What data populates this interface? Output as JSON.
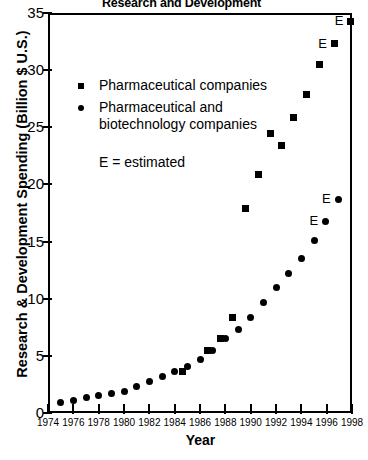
{
  "chart_data": {
    "type": "scatter",
    "title": "Research and Development",
    "xlabel": "Year",
    "ylabel": "Research & Development Spending (Billion $ U.S.)",
    "xlim": [
      1974,
      1998
    ],
    "ylim": [
      0,
      35
    ],
    "xticks": [
      1974,
      1976,
      1978,
      1980,
      1982,
      1984,
      1986,
      1988,
      1990,
      1992,
      1994,
      1996,
      1998
    ],
    "yticks": [
      0,
      5,
      10,
      15,
      20,
      25,
      30,
      35
    ],
    "grid": false,
    "legend_position": "upper-left-inside",
    "legend": [
      {
        "label": "Pharmaceutical companies",
        "marker": "square"
      },
      {
        "label": "Pharmaceutical and\nbiotechnology companies",
        "marker": "circle"
      }
    ],
    "annotations": [
      {
        "text": "E = estimated"
      }
    ],
    "estimated_marker_label": "E",
    "series": [
      {
        "name": "Pharmaceutical companies",
        "marker": "square",
        "points": [
          {
            "x": 1984.6,
            "y": 3.6,
            "estimated": false
          },
          {
            "x": 1986.6,
            "y": 5.5,
            "estimated": false
          },
          {
            "x": 1987.6,
            "y": 6.5,
            "estimated": false
          },
          {
            "x": 1988.6,
            "y": 8.4,
            "estimated": false
          },
          {
            "x": 1989.6,
            "y": 17.9,
            "estimated": false
          },
          {
            "x": 1990.6,
            "y": 20.9,
            "estimated": false
          },
          {
            "x": 1991.6,
            "y": 24.5,
            "estimated": false
          },
          {
            "x": 1992.4,
            "y": 23.4,
            "estimated": false
          },
          {
            "x": 1993.4,
            "y": 25.9,
            "estimated": false
          },
          {
            "x": 1994.4,
            "y": 27.9,
            "estimated": false
          },
          {
            "x": 1995.4,
            "y": 30.5,
            "estimated": false
          },
          {
            "x": 1996.6,
            "y": 32.3,
            "estimated": true
          },
          {
            "x": 1997.9,
            "y": 34.3,
            "estimated": true
          }
        ]
      },
      {
        "name": "Pharmaceutical and biotechnology companies",
        "marker": "circle",
        "points": [
          {
            "x": 1975.0,
            "y": 0.9,
            "estimated": false
          },
          {
            "x": 1976.0,
            "y": 1.1,
            "estimated": false
          },
          {
            "x": 1977.0,
            "y": 1.4,
            "estimated": false
          },
          {
            "x": 1978.0,
            "y": 1.5,
            "estimated": false
          },
          {
            "x": 1979.0,
            "y": 1.7,
            "estimated": false
          },
          {
            "x": 1980.0,
            "y": 1.9,
            "estimated": false
          },
          {
            "x": 1981.0,
            "y": 2.3,
            "estimated": false
          },
          {
            "x": 1982.0,
            "y": 2.8,
            "estimated": false
          },
          {
            "x": 1983.0,
            "y": 3.2,
            "estimated": false
          },
          {
            "x": 1984.0,
            "y": 3.6,
            "estimated": false
          },
          {
            "x": 1985.0,
            "y": 4.1,
            "estimated": false
          },
          {
            "x": 1986.0,
            "y": 4.7,
            "estimated": false
          },
          {
            "x": 1987.0,
            "y": 5.5,
            "estimated": false
          },
          {
            "x": 1988.0,
            "y": 6.5,
            "estimated": false
          },
          {
            "x": 1989.0,
            "y": 7.3,
            "estimated": false
          },
          {
            "x": 1990.0,
            "y": 8.4,
            "estimated": false
          },
          {
            "x": 1991.0,
            "y": 9.7,
            "estimated": false
          },
          {
            "x": 1992.0,
            "y": 11.0,
            "estimated": false
          },
          {
            "x": 1993.0,
            "y": 12.2,
            "estimated": false
          },
          {
            "x": 1994.0,
            "y": 13.5,
            "estimated": false
          },
          {
            "x": 1995.0,
            "y": 15.1,
            "estimated": false
          },
          {
            "x": 1995.9,
            "y": 16.8,
            "estimated": true
          },
          {
            "x": 1996.9,
            "y": 18.7,
            "estimated": true
          }
        ]
      }
    ]
  }
}
